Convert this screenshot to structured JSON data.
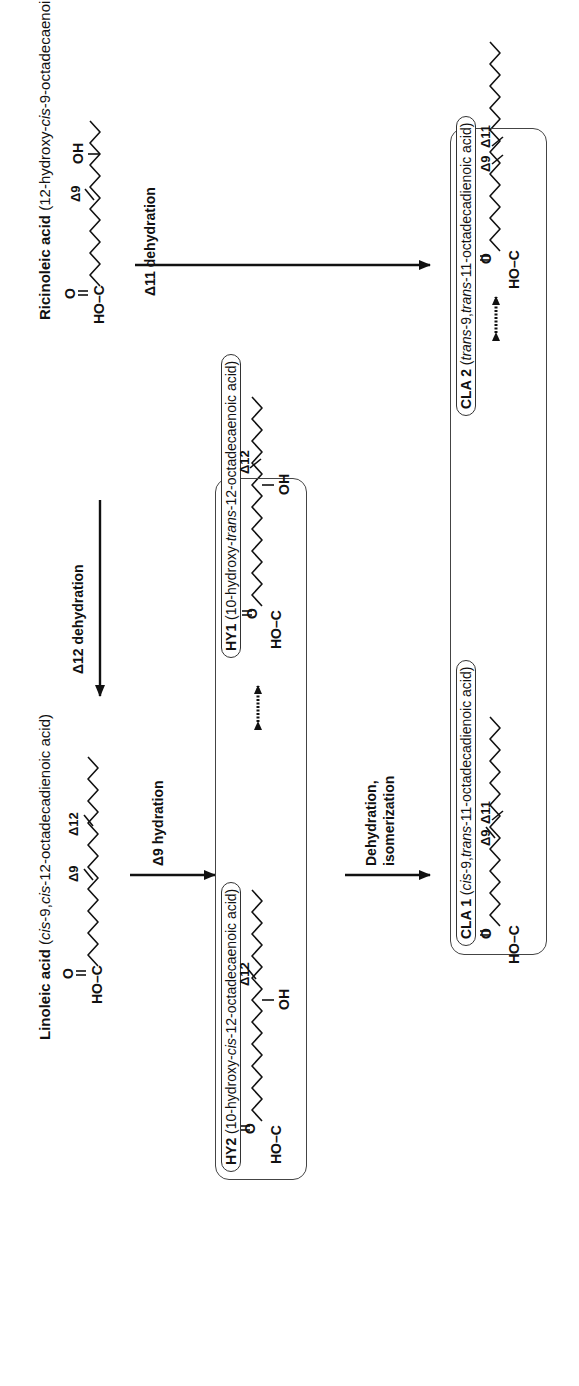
{
  "compounds": {
    "ricinoleic": {
      "name": "Ricinoleic acid",
      "systematic": "(12-hydroxy-cis-9-octadecaenoic acid)",
      "sys_pre": "(12-hydroxy-",
      "sys_ital": "cis",
      "sys_post": "-9-octadecaenoic acid)",
      "delta": "Δ9",
      "oh": "OH",
      "acid_o": "O",
      "acid_hoc": "HO–C"
    },
    "linoleic": {
      "name": "Linoleic acid",
      "systematic": "(cis-9,cis-12-octadecadienoic acid)",
      "sys_pre": "(",
      "sys_ital1": "cis",
      "sys_mid": "-9,",
      "sys_ital2": "cis",
      "sys_post": "-12-octadecadienoic acid)",
      "delta1": "Δ9",
      "delta2": "Δ12",
      "acid_o": "O",
      "acid_hoc": "HO–C"
    },
    "hy1": {
      "name": "HY1",
      "sys_pre": "(10-hydroxy-",
      "sys_ital": "trans",
      "sys_post": "-12-octadecaenoic acid)",
      "delta": "Δ12",
      "oh": "OH",
      "acid_o": "O",
      "acid_hoc": "HO–C"
    },
    "hy2": {
      "name": "HY2",
      "sys_pre": "(10-hydroxy-",
      "sys_ital": "cis",
      "sys_post": "-12-octadecaenoic acid)",
      "delta": "Δ12",
      "oh": "OH",
      "acid_o": "O",
      "acid_hoc": "HO–C"
    },
    "cla1": {
      "name": "CLA 1",
      "sys_pre": "(",
      "sys_ital1": "cis",
      "sys_mid": "-9,",
      "sys_ital2": "trans",
      "sys_post": "-11-octadecadienoic acid)",
      "delta1": "Δ9",
      "delta2": "Δ11",
      "acid_o": "O",
      "acid_hoc": "HO–C"
    },
    "cla2": {
      "name": "CLA 2",
      "sys_pre": "(",
      "sys_ital1": "trans",
      "sys_mid": "-9,",
      "sys_ital2": "trans",
      "sys_post": "-11-octadecadienoic acid)",
      "delta1": "Δ9",
      "delta2": "Δ11",
      "acid_o": "O",
      "acid_hoc": "HO–C"
    }
  },
  "reactions": {
    "d12_dehydration": "Δ12 dehydration",
    "d11_dehydration": "Δ11 dehydration",
    "d9_hydration": "Δ9 hydration",
    "dehydration_line1": "Dehydration,",
    "dehydration_line2": "isomerization"
  },
  "colors": {
    "ink": "#111111",
    "box_border": "#444444",
    "background": "#ffffff"
  }
}
